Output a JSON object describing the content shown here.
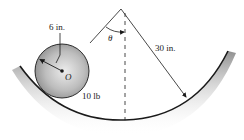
{
  "diagram": {
    "labels": {
      "radius": "6 in.",
      "center": "O",
      "weight": "10 lb",
      "angle": "θ",
      "track_radius": "30 in."
    },
    "colors": {
      "line": "#1a1a1a",
      "ball_fill_center": "#e8e8e8",
      "ball_fill_edge": "#8c8c8c",
      "track_shadow": "#9a9a9a",
      "background": "#ffffff"
    },
    "geometry": {
      "pivot": [
        121,
        9
      ],
      "ball_center": [
        62,
        71
      ],
      "ball_radius": 27,
      "track_bottom": [
        125,
        120
      ],
      "track_left_end": [
        20,
        66
      ],
      "track_right_end": [
        228,
        51
      ],
      "radius_arrow_tip": [
        186,
        97
      ]
    }
  }
}
